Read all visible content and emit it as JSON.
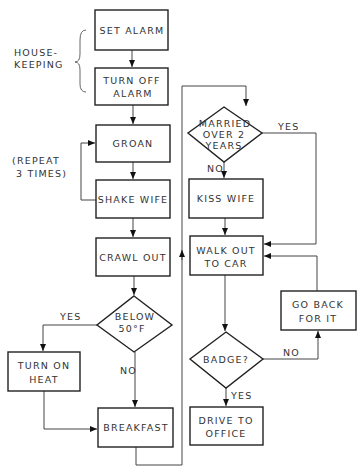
{
  "diagram": {
    "type": "flowchart",
    "annotations": {
      "housekeeping_line1": "HOUSE-",
      "housekeeping_line2": "KEEPING",
      "repeat_line1": "(REPEAT",
      "repeat_line2": "3 TIMES)"
    },
    "nodes": {
      "set_alarm": {
        "line1": "SET ALARM"
      },
      "turn_off_alarm": {
        "line1": "TURN OFF",
        "line2": "ALARM"
      },
      "groan": {
        "line1": "GROAN"
      },
      "shake_wife": {
        "line1": "SHAKE WIFE"
      },
      "crawl_out": {
        "line1": "CRAWL OUT"
      },
      "below_50f": {
        "line1": "BELOW",
        "line2": "50°F"
      },
      "turn_on_heat": {
        "line1": "TURN ON",
        "line2": "HEAT"
      },
      "breakfast": {
        "line1": "BREAKFAST"
      },
      "married": {
        "line1": "MARRIED",
        "line2": "OVER 2",
        "line3": "YEARS"
      },
      "kiss_wife": {
        "line1": "KISS WIFE"
      },
      "walk_out": {
        "line1": "WALK OUT",
        "line2": "TO CAR"
      },
      "badge": {
        "line1": "BADGE?"
      },
      "go_back": {
        "line1": "GO BACK",
        "line2": "FOR IT"
      },
      "drive": {
        "line1": "DRIVE TO",
        "line2": "OFFICE"
      }
    },
    "edge_labels": {
      "below_yes": "YES",
      "below_no": "NO",
      "married_yes": "YES",
      "married_no": "NO",
      "badge_no": "NO",
      "badge_yes": "YES"
    }
  }
}
